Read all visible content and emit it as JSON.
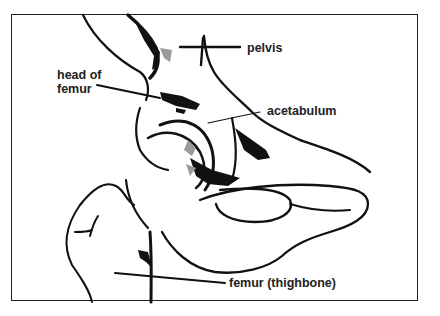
{
  "diagram": {
    "labels": {
      "pelvis": "pelvis",
      "head_of_femur_line1": "head of",
      "head_of_femur_line2": "femur",
      "acetabulum": "acetabulum",
      "femur": "femur (thighbone)"
    },
    "colors": {
      "ink": "#111111",
      "shade": "#9a9a9a",
      "border": "#222222",
      "background": "#ffffff"
    }
  }
}
